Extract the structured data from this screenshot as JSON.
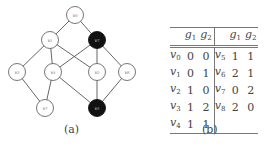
{
  "figure_a": {
    "caption": "(a)",
    "nodes": [
      {
        "id": "top",
        "label": "v",
        "sub": "0",
        "color": "light"
      },
      {
        "id": "mid-left",
        "label": "v",
        "sub": "1",
        "color": "light"
      },
      {
        "id": "mid-right",
        "label": "v",
        "sub": "7",
        "color": "dark"
      },
      {
        "id": "row3-a",
        "label": "v",
        "sub": "3",
        "color": "light"
      },
      {
        "id": "row3-b",
        "label": "v",
        "sub": "4",
        "color": "light"
      },
      {
        "id": "row3-c",
        "label": "v",
        "sub": "2",
        "color": "light"
      },
      {
        "id": "row3-d",
        "label": "v",
        "sub": "6",
        "color": "light"
      },
      {
        "id": "bottom-left",
        "label": "v",
        "sub": "7",
        "color": "light"
      },
      {
        "id": "bottom-right",
        "label": "v",
        "sub": "5",
        "color": "dark"
      }
    ],
    "edges": [
      [
        "top",
        "mid-left"
      ],
      [
        "top",
        "mid-right"
      ],
      [
        "mid-left",
        "row3-a"
      ],
      [
        "mid-left",
        "row3-b"
      ],
      [
        "mid-left",
        "row3-c"
      ],
      [
        "mid-right",
        "row3-b"
      ],
      [
        "mid-right",
        "row3-c"
      ],
      [
        "mid-right",
        "row3-d"
      ],
      [
        "row3-a",
        "bottom-left"
      ],
      [
        "row3-b",
        "bottom-left"
      ],
      [
        "row3-b",
        "bottom-right"
      ],
      [
        "row3-c",
        "bottom-right"
      ],
      [
        "row3-d",
        "bottom-right"
      ]
    ],
    "colors": {
      "light_fill": "#ffffff",
      "dark_fill": "#111111",
      "edge": "#555555"
    }
  },
  "figure_b": {
    "caption": "(b)",
    "headers": {
      "g1": "g",
      "g1_sub": "1",
      "g2": "g",
      "g2_sub": "2"
    },
    "left_rows": [
      {
        "v": "v",
        "sub": "0",
        "g1": "0",
        "g2": "0"
      },
      {
        "v": "v",
        "sub": "1",
        "g1": "0",
        "g2": "1"
      },
      {
        "v": "v",
        "sub": "2",
        "g1": "1",
        "g2": "0"
      },
      {
        "v": "v",
        "sub": "3",
        "g1": "1",
        "g2": "2"
      },
      {
        "v": "v",
        "sub": "4",
        "g1": "1",
        "g2": "1"
      }
    ],
    "right_rows": [
      {
        "v": "v",
        "sub": "5",
        "g1": "1",
        "g2": "1"
      },
      {
        "v": "v",
        "sub": "6",
        "g1": "2",
        "g2": "1"
      },
      {
        "v": "v",
        "sub": "7",
        "g1": "0",
        "g2": "2"
      },
      {
        "v": "v",
        "sub": "8",
        "g1": "2",
        "g2": "0"
      },
      {
        "v": "",
        "sub": "",
        "g1": "",
        "g2": ""
      }
    ]
  }
}
